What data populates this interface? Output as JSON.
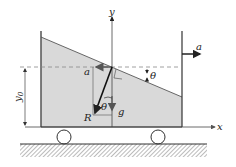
{
  "diagram": {
    "labels": {
      "y_axis": "y",
      "x_axis": "x",
      "acceleration_outside": "a",
      "acceleration_inside": "a",
      "gravity": "g",
      "resultant": "R",
      "angle_surface": "θ",
      "angle_vector": "θ",
      "depth": "y",
      "depth_sub": "0"
    },
    "colors": {
      "fluid": "#d9d9d9",
      "line": "#333333",
      "dashed": "#888888"
    }
  }
}
